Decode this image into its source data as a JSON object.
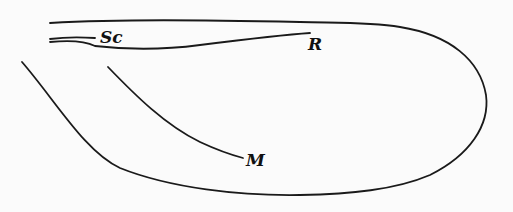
{
  "diagram": {
    "labels": {
      "sc": "Sc",
      "r": "R",
      "m": "M"
    },
    "colors": {
      "background": "#fbfbfb",
      "ink": "#1a1a1a"
    }
  }
}
